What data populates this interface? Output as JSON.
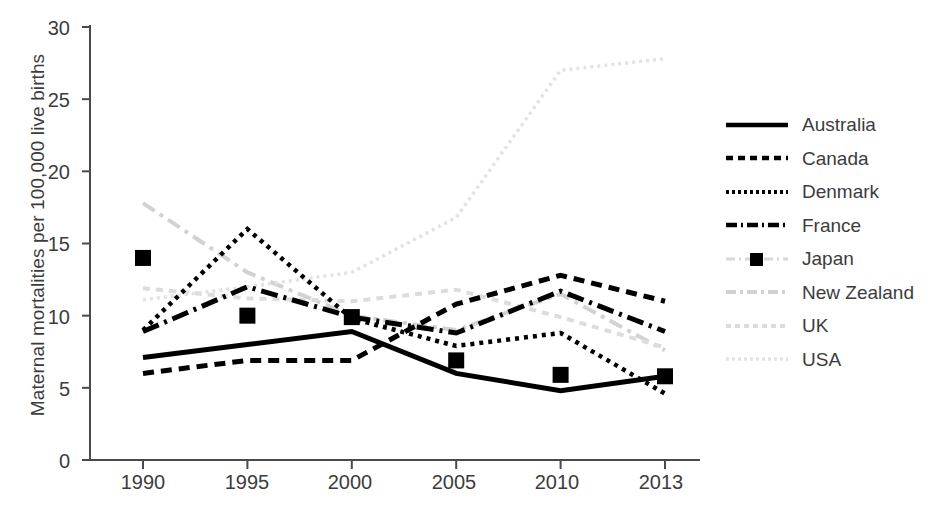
{
  "chart_data": {
    "type": "line",
    "title": "",
    "xlabel": "",
    "ylabel": "Maternal mortalities per 100,000 live births",
    "categories": [
      "1990",
      "1995",
      "2000",
      "2005",
      "2010",
      "2013"
    ],
    "x": [
      1990,
      1995,
      2000,
      2005,
      2010,
      2013
    ],
    "xlim": [
      1990,
      2013
    ],
    "ylim": [
      0,
      30
    ],
    "yticks": [
      0,
      5,
      10,
      15,
      20,
      25,
      30
    ],
    "grid": false,
    "legend_position": "right",
    "series": [
      {
        "name": "Australia",
        "style": "solid",
        "color": "#000000",
        "values": [
          7.1,
          8.0,
          8.9,
          6.0,
          4.8,
          5.8
        ]
      },
      {
        "name": "Canada",
        "style": "dashed",
        "color": "#000000",
        "values": [
          6.0,
          6.9,
          6.9,
          10.8,
          12.8,
          11.0
        ]
      },
      {
        "name": "Denmark",
        "style": "dotted",
        "color": "#000000",
        "values": [
          9.0,
          16.0,
          9.8,
          7.9,
          8.8,
          4.6
        ]
      },
      {
        "name": "France",
        "style": "dash-dot",
        "color": "#000000",
        "values": [
          8.9,
          12.0,
          9.9,
          8.8,
          11.7,
          8.9
        ]
      },
      {
        "name": "Japan",
        "style": "marker-square",
        "color": "#000000",
        "values": [
          14.0,
          10.0,
          9.9,
          6.9,
          5.9,
          5.8
        ]
      },
      {
        "name": "New Zealand",
        "style": "dash-dot-light",
        "color": "#d2d2d2",
        "values": [
          17.8,
          13.0,
          10.0,
          9.0,
          11.5,
          7.6
        ]
      },
      {
        "name": "UK",
        "style": "dashed-light",
        "color": "#dcdcdc",
        "values": [
          11.9,
          11.2,
          11.0,
          11.8,
          9.9,
          7.8
        ]
      },
      {
        "name": "USA",
        "style": "dotted-light",
        "color": "#e2e2e2",
        "values": [
          11.1,
          12.0,
          13.0,
          16.8,
          27.0,
          27.8
        ]
      }
    ]
  },
  "axis": {
    "y_tick_labels": [
      "30",
      "25",
      "20",
      "15",
      "10",
      "5",
      "0"
    ],
    "x_tick_labels": [
      "1990",
      "1995",
      "2000",
      "2005",
      "2010",
      "2013"
    ],
    "y_axis_title": "Maternal mortalities per 100,000 live births"
  },
  "legend": {
    "items": [
      {
        "label": "Australia"
      },
      {
        "label": "Canada"
      },
      {
        "label": "Denmark"
      },
      {
        "label": "France"
      },
      {
        "label": "Japan"
      },
      {
        "label": "New Zealand"
      },
      {
        "label": "UK"
      },
      {
        "label": "USA"
      }
    ]
  }
}
